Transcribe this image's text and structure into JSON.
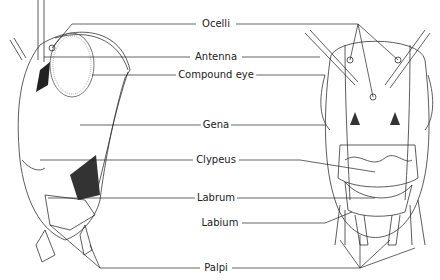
{
  "diagram": {
    "labels": [
      {
        "id": "ocelli",
        "text": "Ocelli",
        "x": 216,
        "y": 24
      },
      {
        "id": "antenna",
        "text": "Antenna",
        "x": 216,
        "y": 57
      },
      {
        "id": "compound-eye",
        "text": "Compound eye",
        "x": 216,
        "y": 75
      },
      {
        "id": "gena",
        "text": "Gena",
        "x": 216,
        "y": 125
      },
      {
        "id": "clypeus",
        "text": "Clypeus",
        "x": 216,
        "y": 160
      },
      {
        "id": "labrum",
        "text": "Labrum",
        "x": 216,
        "y": 198
      },
      {
        "id": "labium",
        "text": "Labium",
        "x": 220,
        "y": 223
      },
      {
        "id": "palpi",
        "text": "Palpi",
        "x": 216,
        "y": 268
      }
    ]
  }
}
